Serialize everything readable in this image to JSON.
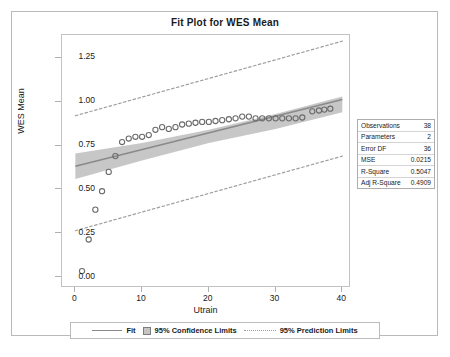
{
  "chart_data": {
    "type": "scatter",
    "title": "Fit Plot for WES Mean",
    "xlabel": "Utrain",
    "ylabel": "WES Mean",
    "xlim": [
      -2,
      41
    ],
    "ylim": [
      -0.05,
      1.38
    ],
    "xticks": [
      0,
      10,
      20,
      30,
      40
    ],
    "xtick_labels": [
      "0",
      "10",
      "20",
      "30",
      "40"
    ],
    "yticks": [
      0.0,
      0.25,
      0.5,
      0.75,
      1.0,
      1.25
    ],
    "ytick_labels": [
      "0.00",
      "0.25",
      "0.50",
      "0.75",
      "1.00",
      "1.25"
    ],
    "grid": false,
    "legend_position": "bottom",
    "series": [
      {
        "name": "Observed",
        "type": "scatter",
        "marker": "open-circle",
        "points": [
          [
            1.0,
            0.035
          ],
          [
            2.0,
            0.215
          ],
          [
            3.0,
            0.385
          ],
          [
            4.0,
            0.49
          ],
          [
            5.0,
            0.6
          ],
          [
            6.0,
            0.69
          ],
          [
            7.0,
            0.77
          ],
          [
            8.0,
            0.79
          ],
          [
            9.0,
            0.8
          ],
          [
            10.0,
            0.8
          ],
          [
            11.0,
            0.81
          ],
          [
            12.0,
            0.84
          ],
          [
            13.0,
            0.855
          ],
          [
            14.0,
            0.845
          ],
          [
            15.0,
            0.855
          ],
          [
            16.0,
            0.87
          ],
          [
            17.0,
            0.875
          ],
          [
            18.0,
            0.88
          ],
          [
            19.0,
            0.885
          ],
          [
            20.0,
            0.885
          ],
          [
            21.0,
            0.89
          ],
          [
            22.0,
            0.895
          ],
          [
            23.0,
            0.9
          ],
          [
            24.0,
            0.905
          ],
          [
            25.0,
            0.915
          ],
          [
            26.0,
            0.915
          ],
          [
            27.0,
            0.905
          ],
          [
            28.0,
            0.905
          ],
          [
            29.0,
            0.905
          ],
          [
            30.0,
            0.905
          ],
          [
            31.0,
            0.905
          ],
          [
            32.0,
            0.905
          ],
          [
            33.0,
            0.905
          ],
          [
            34.0,
            0.91
          ],
          [
            35.5,
            0.945
          ],
          [
            36.5,
            0.95
          ],
          [
            37.3,
            0.955
          ],
          [
            38.2,
            0.96
          ]
        ]
      },
      {
        "name": "Fit",
        "type": "line",
        "x": [
          0,
          40
        ],
        "y": [
          0.632,
          1.012
        ]
      },
      {
        "name": "95% Confidence Limits",
        "type": "band",
        "x": [
          0,
          10,
          20,
          30,
          40
        ],
        "upper": [
          0.705,
          0.765,
          0.84,
          0.93,
          1.03
        ],
        "lower": [
          0.56,
          0.665,
          0.765,
          0.845,
          0.94
        ]
      },
      {
        "name": "95% Prediction Limits",
        "type": "band-dashed",
        "x": [
          0,
          40
        ],
        "upper": [
          0.92,
          1.345
        ],
        "lower": [
          0.265,
          0.69
        ]
      }
    ],
    "legend": [
      {
        "label": "Fit",
        "style": "line"
      },
      {
        "label": "95% Confidence Limits",
        "style": "band"
      },
      {
        "label": "95% Prediction Limits",
        "style": "dotted"
      }
    ],
    "stats": [
      {
        "key": "Observations",
        "value": "38"
      },
      {
        "key": "Parameters",
        "value": "2"
      },
      {
        "key": "Error DF",
        "value": "36"
      },
      {
        "key": "MSE",
        "value": "0.0215"
      },
      {
        "key": "R-Square",
        "value": "0.5047"
      },
      {
        "key": "Adj R-Square",
        "value": "0.4909"
      }
    ],
    "colors": {
      "fit_line": "#8a8a8a",
      "confidence_band": "#c4c4c4",
      "prediction_limits": "#9e9e9e",
      "marker_stroke": "#6b6b6b",
      "frame": "#c2c2c2",
      "text": "#1a1a1a"
    }
  }
}
